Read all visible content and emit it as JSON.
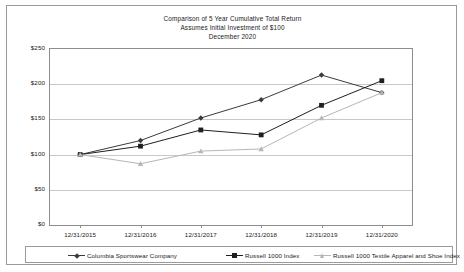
{
  "chart_data": {
    "type": "line",
    "title": "Comparison of 5 Year Cumulative Total Return",
    "subtitle": "Assumes Initial Investment of $100",
    "date_line": "December 2020",
    "xlabel": "",
    "ylabel": "",
    "grid": true,
    "legend_position": "bottom",
    "ylim": [
      0,
      250
    ],
    "ytick_labels": [
      "$0",
      "$50",
      "$100",
      "$150",
      "$200",
      "$250"
    ],
    "ytick_values": [
      0,
      50,
      100,
      150,
      200,
      250
    ],
    "categories": [
      "12/31/2015",
      "12/31/2016",
      "12/31/2017",
      "12/31/2018",
      "12/31/2019",
      "12/31/2020"
    ],
    "series": [
      {
        "name": "Columbia Sportswear Company",
        "marker": "diamond",
        "color": "#3b3b3b",
        "values": [
          100,
          120,
          152,
          178,
          213,
          188
        ]
      },
      {
        "name": "Russell 1000 Index",
        "marker": "square",
        "color": "#1f1f1f",
        "values": [
          100,
          112,
          135,
          128,
          170,
          205
        ]
      },
      {
        "name": "Russell 1000 Textile Apparel and Shoe Index",
        "marker": "triangle",
        "color": "#b6b6b6",
        "values": [
          100,
          87,
          105,
          108,
          152,
          188
        ]
      }
    ]
  },
  "colors": {
    "frame_border": "#9a9a9a",
    "plot_border": "#8d8d8d",
    "gridline": "#c8c8c8",
    "text": "#1a1a1a",
    "background": "#ffffff"
  }
}
